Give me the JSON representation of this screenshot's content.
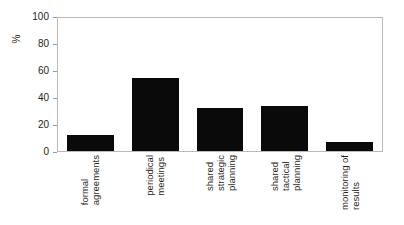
{
  "chart_data": {
    "type": "bar",
    "title": "",
    "xlabel": "",
    "ylabel": "%",
    "categories": [
      "formal agreements",
      "periodical meetings",
      "shared strategic planning",
      "shared tactical planning",
      "monitoring of results"
    ],
    "category_lines": [
      [
        "formal",
        "agreements"
      ],
      [
        "periodical",
        "meetings"
      ],
      [
        "shared",
        "strategic",
        "planning"
      ],
      [
        "shared",
        "tactical",
        "planning"
      ],
      [
        "monitoring of",
        "results"
      ]
    ],
    "values": [
      12,
      55,
      32,
      34,
      7
    ],
    "ylim": [
      0,
      100
    ],
    "yticks": [
      0,
      20,
      40,
      60,
      80,
      100
    ],
    "ytick_labels": [
      "0",
      "20",
      "40",
      "60",
      "80",
      "100"
    ],
    "grid": false,
    "legend": null,
    "bar_color": "#0a0a0a",
    "frame_color": "#b9b9b9",
    "background": "#ffffff"
  }
}
